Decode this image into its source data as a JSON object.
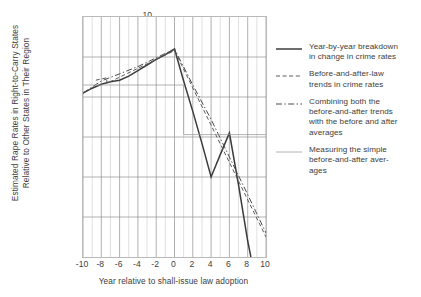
{
  "chart_data": {
    "type": "line",
    "title": "",
    "xlabel": "Year relative to shall-issue law adoption",
    "ylabel_line1": "Estimated Rape Rates in Right-to-Carry States",
    "ylabel_line2": "Relative to Other States in Their Region",
    "xlim": [
      -10,
      10
    ],
    "ylim": [
      -0.2,
      0.1
    ],
    "xticks": [
      -10,
      -8,
      -6,
      -4,
      -2,
      0,
      2,
      4,
      6,
      8,
      10
    ],
    "xtick_labels": [
      "-10",
      "-8",
      "-6",
      "-4",
      "-2",
      "0",
      "2",
      "4",
      "6",
      "8",
      "10"
    ],
    "yticks": [
      0.1,
      0.05,
      0,
      -0.05,
      -0.1,
      -0.15,
      -0.2
    ],
    "ytick_labels": [
      ".10",
      ".05",
      "0",
      "-.05",
      "-.10",
      "-.15",
      "-.20"
    ],
    "grid": "both-axes-light",
    "legend_position": "right",
    "series": [
      {
        "name": "Year-by-year breakdown in change in crime rates",
        "style": "solid-thick",
        "color": "#3c3c3c",
        "x": [
          -10,
          -9,
          -8,
          -7,
          -6,
          -5,
          -4,
          -3,
          -2,
          -1,
          0,
          1,
          2,
          3,
          4,
          5,
          6,
          7,
          8,
          8.35
        ],
        "y": [
          0.005,
          0.011,
          0.016,
          0.019,
          0.021,
          0.026,
          0.033,
          0.04,
          0.047,
          0.053,
          0.06,
          0.02,
          -0.018,
          -0.058,
          -0.1,
          -0.072,
          -0.045,
          -0.11,
          -0.18,
          -0.2
        ]
      },
      {
        "name": "Before-and-after-law trends in crime rates",
        "style": "dashed",
        "color": "#5a5a5a",
        "x": [
          -8.6,
          -7.4,
          -7.4,
          0,
          10
        ],
        "y": [
          0.021,
          0.024,
          0.017,
          0.058,
          -0.175
        ]
      },
      {
        "name": "Combining both the before-and-after trends with the before and after averages",
        "style": "dash-dot",
        "color": "#4a4a4a",
        "x": [
          -10,
          -8,
          -6,
          -4,
          -2,
          0,
          2,
          4,
          6,
          8,
          10
        ],
        "y": [
          0.005,
          0.02,
          0.029,
          0.038,
          0.049,
          0.06,
          0.015,
          -0.028,
          -0.075,
          -0.122,
          -0.17
        ]
      },
      {
        "name": "Measuring the simple before-and-after averages",
        "style": "solid-thin",
        "color": "#9a9a9a",
        "x": [
          -10,
          1,
          1,
          10
        ],
        "y": [
          0.015,
          0.015,
          -0.047,
          -0.047
        ]
      }
    ]
  },
  "legend": {
    "items": [
      {
        "key": "solid-thick",
        "lines": [
          "Year-by-year breakdown",
          "in change in crime rates"
        ]
      },
      {
        "key": "dashed",
        "lines": [
          "Before-and-after-law",
          "trends in crime rates"
        ]
      },
      {
        "key": "dash-dot",
        "lines": [
          "Combining both the",
          "before-and-after trends",
          "with the before and after",
          "averages"
        ]
      },
      {
        "key": "solid-thin",
        "lines": [
          "Measuring the simple",
          "before-and-after aver-",
          "ages"
        ]
      }
    ]
  },
  "colors": {
    "frame": "#b9b9b9",
    "grid_major": "#8f8f8f",
    "grid_minor": "#c9c9c9",
    "text": "#3d3d3d"
  }
}
